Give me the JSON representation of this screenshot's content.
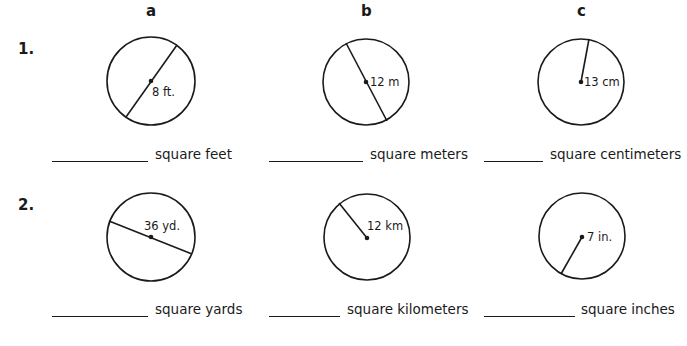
{
  "columns": [
    "a",
    "b",
    "c"
  ],
  "rows": [
    {
      "number": "1.",
      "problems": [
        {
          "id": "1a",
          "label": "8 ft.",
          "segment": "diameter",
          "unit": "square feet",
          "answer": ""
        },
        {
          "id": "1b",
          "label": "12 m",
          "segment": "diameter",
          "unit": "square meters",
          "answer": ""
        },
        {
          "id": "1c",
          "label": "13 cm",
          "segment": "radius",
          "unit": "square centimeters",
          "answer": ""
        }
      ]
    },
    {
      "number": "2.",
      "problems": [
        {
          "id": "2a",
          "label": "36 yd.",
          "segment": "diameter",
          "unit": "square yards",
          "answer": ""
        },
        {
          "id": "2b",
          "label": "12 km",
          "segment": "radius",
          "unit": "square kilometers",
          "answer": ""
        },
        {
          "id": "2c",
          "label": "7 in.",
          "segment": "radius",
          "unit": "square inches",
          "answer": ""
        }
      ]
    }
  ],
  "colors": {
    "ink": "#1a1a1a",
    "paper": "#ffffff"
  }
}
